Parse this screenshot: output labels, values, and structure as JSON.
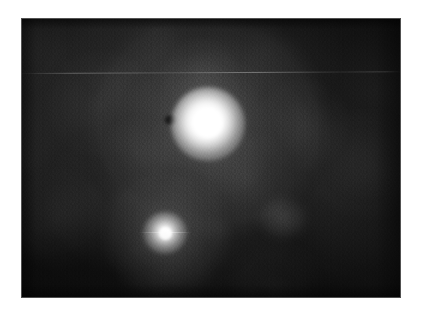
{
  "page": {
    "kind": "astronomical-image",
    "background_color": "#ffffff",
    "canvas": {
      "width": 424,
      "height": 320
    }
  },
  "image_plate": {
    "name": "grayscale-astronomical-field",
    "description": "Grayscale noisy astronomical field containing two unresolved bright sources on a dark mottled background",
    "x": 21,
    "y": 18,
    "width": 380,
    "height": 280,
    "background_color": "#101010",
    "border_color": "#8c8c8c",
    "colormap": "grayscale",
    "caption": "",
    "label": ""
  },
  "features": {
    "primary_source": {
      "label": "",
      "center_x": 208,
      "center_y": 124,
      "core_radius_px": 15,
      "full_radius_px": 37,
      "peak_color": "#ffffff",
      "relative_brightness": 1.0
    },
    "primary_halo": {
      "label": "",
      "center_x": 208,
      "center_y": 124,
      "radius_x_px": 116,
      "radius_y_px": 111,
      "relative_brightness": 0.3
    },
    "secondary_source": {
      "label": "",
      "center_x": 165,
      "center_y": 233,
      "core_radius_px": 6,
      "full_radius_px": 22,
      "peak_color": "#ffffff",
      "relative_brightness": 0.78
    },
    "secondary_halo": {
      "label": "",
      "center_x": 165,
      "center_y": 233,
      "radius_x_px": 62,
      "radius_y_px": 59,
      "relative_brightness": 0.22
    },
    "faint_knot": {
      "label": "",
      "center_x": 283,
      "center_y": 218,
      "relative_brightness": 0.17
    },
    "dark_spot": {
      "label": "",
      "center_x": 170,
      "center_y": 120,
      "relative_brightness": 0.0
    },
    "scan_streak": {
      "label": "",
      "y": 73,
      "relative_brightness": 0.3
    }
  },
  "annotations": {
    "title": "",
    "axis_labels": [],
    "tick_labels": [],
    "legend": [],
    "scale_bar": ""
  }
}
